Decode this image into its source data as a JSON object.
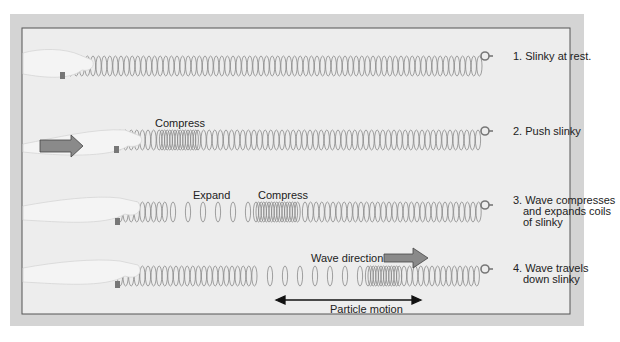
{
  "diagram": {
    "rows": [
      {
        "step": "1. Slinky at rest.",
        "lines": [
          "1. Slinky at rest."
        ]
      },
      {
        "step": "2. Push slinky",
        "lines": [
          "2. Push slinky"
        ],
        "annotation": "Compress"
      },
      {
        "step": "3. Wave compresses and expands coils of slinky",
        "lines": [
          "3. Wave compresses",
          "and expands coils",
          "of slinky"
        ],
        "annotations": [
          "Expand",
          "Compress"
        ]
      },
      {
        "step": "4. Wave travels down slinky",
        "lines": [
          "4. Wave travels",
          "down slinky"
        ],
        "annotations": [
          "Wave direction",
          "Particle motion"
        ]
      }
    ],
    "colors": {
      "frame_outer": "#d4d4d4",
      "frame_inner": "#ececec",
      "border": "#555555",
      "arrow_fill": "#8a8a8a",
      "coil": "#888888",
      "hand": "#f2f2f2"
    }
  }
}
